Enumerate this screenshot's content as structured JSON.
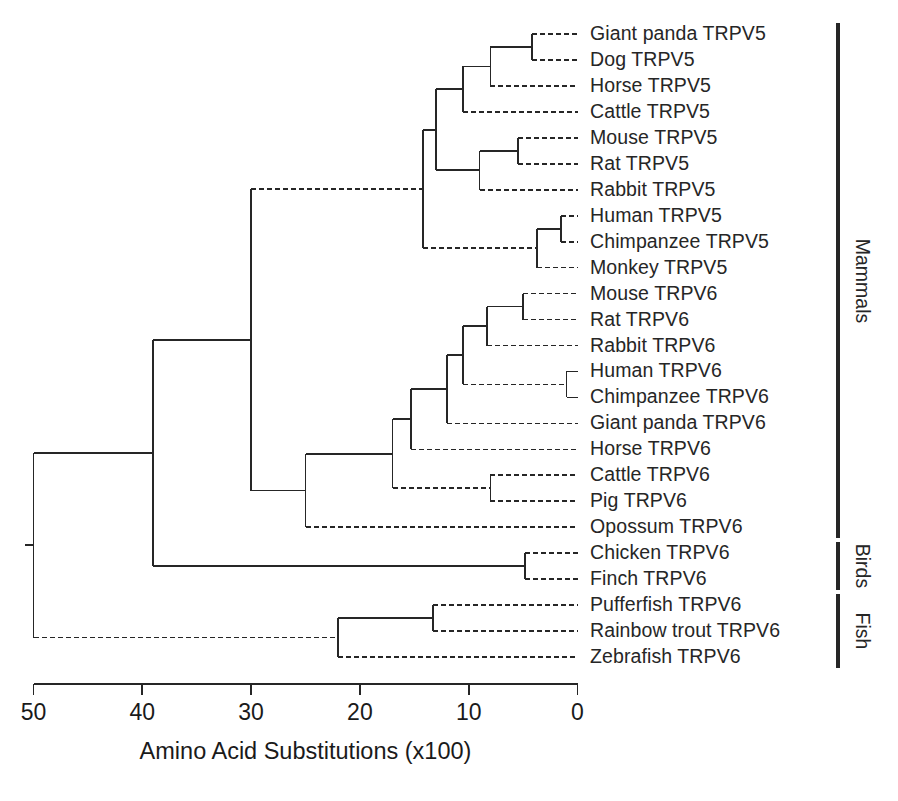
{
  "figure": {
    "type": "phylogenetic-tree-dendrogram",
    "background_color": "#ffffff",
    "line_color": "#262626",
    "width": 898,
    "height": 801
  },
  "axis": {
    "title": "Amino Acid Substitutions (x100)",
    "tick_labels": [
      "50",
      "40",
      "30",
      "20",
      "10",
      "0"
    ],
    "tick_values": [
      50,
      40,
      30,
      20,
      10,
      0
    ],
    "direction": "right-to-left",
    "min": 0,
    "max": 50
  },
  "group_brackets": [
    {
      "label": "Mammals",
      "from_taxon": "Giant panda TRPV5",
      "to_taxon": "Opossum TRPV6",
      "count": 21
    },
    {
      "label": "Birds",
      "from_taxon": "Chicken TRPV6",
      "to_taxon": "Finch TRPV6",
      "count": 2
    },
    {
      "label": "Fish",
      "from_taxon": "Pufferfish TRPV6",
      "to_taxon": "Zebrafish TRPV6",
      "count": 3
    }
  ],
  "taxa": [
    {
      "label": "Giant panda TRPV5",
      "group": "Mammals",
      "gene": "TRPV5"
    },
    {
      "label": "Dog TRPV5",
      "group": "Mammals",
      "gene": "TRPV5"
    },
    {
      "label": "Horse TRPV5",
      "group": "Mammals",
      "gene": "TRPV5"
    },
    {
      "label": "Cattle TRPV5",
      "group": "Mammals",
      "gene": "TRPV5"
    },
    {
      "label": "Mouse TRPV5",
      "group": "Mammals",
      "gene": "TRPV5"
    },
    {
      "label": "Rat TRPV5",
      "group": "Mammals",
      "gene": "TRPV5"
    },
    {
      "label": "Rabbit TRPV5",
      "group": "Mammals",
      "gene": "TRPV5"
    },
    {
      "label": "Human TRPV5",
      "group": "Mammals",
      "gene": "TRPV5"
    },
    {
      "label": "Chimpanzee TRPV5",
      "group": "Mammals",
      "gene": "TRPV5"
    },
    {
      "label": "Monkey TRPV5",
      "group": "Mammals",
      "gene": "TRPV5"
    },
    {
      "label": "Mouse TRPV6",
      "group": "Mammals",
      "gene": "TRPV6"
    },
    {
      "label": "Rat TRPV6",
      "group": "Mammals",
      "gene": "TRPV6"
    },
    {
      "label": "Rabbit TRPV6",
      "group": "Mammals",
      "gene": "TRPV6"
    },
    {
      "label": "Human TRPV6",
      "group": "Mammals",
      "gene": "TRPV6"
    },
    {
      "label": "Chimpanzee TRPV6",
      "group": "Mammals",
      "gene": "TRPV6"
    },
    {
      "label": "Giant panda TRPV6",
      "group": "Mammals",
      "gene": "TRPV6"
    },
    {
      "label": "Horse TRPV6",
      "group": "Mammals",
      "gene": "TRPV6"
    },
    {
      "label": "Cattle TRPV6",
      "group": "Mammals",
      "gene": "TRPV6"
    },
    {
      "label": "Pig TRPV6",
      "group": "Mammals",
      "gene": "TRPV6"
    },
    {
      "label": "Opossum TRPV6",
      "group": "Mammals",
      "gene": "TRPV6"
    },
    {
      "label": "Chicken TRPV6",
      "group": "Birds",
      "gene": "TRPV6"
    },
    {
      "label": "Finch TRPV6",
      "group": "Birds",
      "gene": "TRPV6"
    },
    {
      "label": "Pufferfish TRPV6",
      "group": "Fish",
      "gene": "TRPV6"
    },
    {
      "label": "Rainbow trout TRPV6",
      "group": "Fish",
      "gene": "TRPV6"
    },
    {
      "label": "Zebrafish TRPV6",
      "group": "Fish",
      "gene": "TRPV6"
    }
  ],
  "chart_data": {
    "type": "tree",
    "title": "",
    "xlabel": "Amino Acid Substitutions (x100)",
    "ylabel": "",
    "xlim": [
      50,
      0
    ],
    "xticks": [
      50,
      40,
      30,
      20,
      10,
      0
    ],
    "grid": false,
    "legend": "none",
    "leaf_order": [
      "Giant panda TRPV5",
      "Dog TRPV5",
      "Horse TRPV5",
      "Cattle TRPV5",
      "Mouse TRPV5",
      "Rat TRPV5",
      "Rabbit TRPV5",
      "Human TRPV5",
      "Chimpanzee TRPV5",
      "Monkey TRPV5",
      "Mouse TRPV6",
      "Rat TRPV6",
      "Rabbit TRPV6",
      "Human TRPV6",
      "Chimpanzee TRPV6",
      "Giant panda TRPV6",
      "Horse TRPV6",
      "Cattle TRPV6",
      "Pig TRPV6",
      "Opossum TRPV6",
      "Chicken TRPV6",
      "Finch TRPV6",
      "Pufferfish TRPV6",
      "Rainbow trout TRPV6",
      "Zebrafish TRPV6"
    ],
    "nodes": [
      {
        "id": "root",
        "depth": 50.0,
        "children": [
          "vertebrate_tetrapods",
          "fish_clade"
        ]
      },
      {
        "id": "vertebrate_tetrapods",
        "depth": 39.0,
        "children": [
          "trpv_clade",
          "birds_clade"
        ]
      },
      {
        "id": "trpv_clade",
        "depth": 30.0,
        "children": [
          "trpv5_clade",
          "trpv6_mammal_clade"
        ]
      },
      {
        "id": "trpv5_clade",
        "depth": 14.2,
        "children": [
          "trpv5_nonprimate",
          "trpv5_primate"
        ]
      },
      {
        "id": "trpv5_nonprimate",
        "depth": 13.0,
        "children": [
          "trpv5_carnivore_ungulate",
          "trpv5_rodent_lagomorph"
        ]
      },
      {
        "id": "trpv5_carnivore_ungulate",
        "depth": 10.5,
        "children": [
          "trpv5_panda_dog_horse",
          "Cattle TRPV5"
        ]
      },
      {
        "id": "trpv5_panda_dog_horse",
        "depth": 8.0,
        "children": [
          "trpv5_panda_dog",
          "Horse TRPV5"
        ]
      },
      {
        "id": "trpv5_panda_dog",
        "depth": 4.2,
        "children": [
          "Giant panda TRPV5",
          "Dog TRPV5"
        ]
      },
      {
        "id": "trpv5_rodent_lagomorph",
        "depth": 9.0,
        "children": [
          "trpv5_mouse_rat",
          "Rabbit TRPV5"
        ]
      },
      {
        "id": "trpv5_mouse_rat",
        "depth": 5.5,
        "children": [
          "Mouse TRPV5",
          "Rat TRPV5"
        ]
      },
      {
        "id": "trpv5_primate",
        "depth": 3.7,
        "children": [
          "trpv5_human_chimp",
          "Monkey TRPV5"
        ]
      },
      {
        "id": "trpv5_human_chimp",
        "depth": 1.5,
        "children": [
          "Human TRPV5",
          "Chimpanzee TRPV5"
        ]
      },
      {
        "id": "trpv6_mammal_clade",
        "depth": 25.0,
        "children": [
          "trpv6_eutherian",
          "Opossum TRPV6"
        ]
      },
      {
        "id": "trpv6_eutherian",
        "depth": 17.0,
        "children": [
          "trpv6_core",
          "trpv6_cattle_pig"
        ]
      },
      {
        "id": "trpv6_core",
        "depth": 15.3,
        "children": [
          "trpv6_upper",
          "Horse TRPV6"
        ]
      },
      {
        "id": "trpv6_upper",
        "depth": 12.0,
        "children": [
          "trpv6_rodent_primate",
          "Giant panda TRPV6"
        ]
      },
      {
        "id": "trpv6_rodent_primate",
        "depth": 10.5,
        "children": [
          "trpv6_rodent_lagomorph",
          "trpv6_primate"
        ]
      },
      {
        "id": "trpv6_rodent_lagomorph",
        "depth": 8.3,
        "children": [
          "trpv6_mouse_rat",
          "Rabbit TRPV6"
        ]
      },
      {
        "id": "trpv6_mouse_rat",
        "depth": 5.0,
        "children": [
          "Mouse TRPV6",
          "Rat TRPV6"
        ]
      },
      {
        "id": "trpv6_primate",
        "depth": 1.0,
        "children": [
          "Human TRPV6",
          "Chimpanzee TRPV6"
        ]
      },
      {
        "id": "trpv6_cattle_pig",
        "depth": 8.0,
        "children": [
          "Cattle TRPV6",
          "Pig TRPV6"
        ]
      },
      {
        "id": "birds_clade",
        "depth": 4.8,
        "children": [
          "Chicken TRPV6",
          "Finch TRPV6"
        ]
      },
      {
        "id": "fish_clade",
        "depth": 22.0,
        "children": [
          "fish_puffer_trout",
          "Zebrafish TRPV6"
        ]
      },
      {
        "id": "fish_puffer_trout",
        "depth": 13.3,
        "children": [
          "Pufferfish TRPV6",
          "Rainbow trout TRPV6"
        ]
      }
    ]
  }
}
